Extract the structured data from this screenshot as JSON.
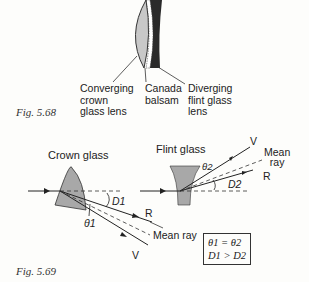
{
  "figures": [
    {
      "caption": "Fig. 5.68",
      "labels": {
        "crown": [
          "Converging",
          "crown",
          "glass lens"
        ],
        "balsam": [
          "Canada",
          "balsam"
        ],
        "flint": [
          "Diverging",
          "flint glass",
          "lens"
        ]
      }
    },
    {
      "caption": "Fig. 5.69",
      "crown_title": "Crown glass",
      "flint_title": "Flint glass",
      "crown_rays": {
        "R": "R",
        "V": "V",
        "mean": "Mean ray",
        "theta": "θ1",
        "D": "D1"
      },
      "flint_rays": {
        "R": "R",
        "V": "V",
        "mean_1": "Mean",
        "mean_2": "ray",
        "theta": "θ2",
        "D": "D2"
      },
      "equations": [
        "θ1 = θ2",
        "D1 > D2"
      ]
    }
  ]
}
